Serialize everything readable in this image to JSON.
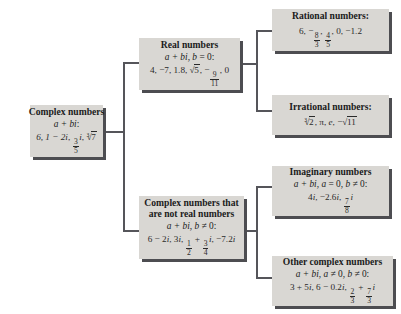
{
  "diagram": {
    "background_color": "#ffffff",
    "box_color": "#d9d7d3",
    "shadow_color": "#4d4d51",
    "line_color": "#55555a",
    "nodes": {
      "complex": {
        "title": "Complex numbers",
        "form_prefix": "a + bi",
        "form_suffix": ":",
        "examples_lead": "6, 1 − 2",
        "examples_i1": "i",
        "examples_mid": ", ",
        "frac1_num": "3",
        "frac1_den": "5",
        "examples_i2": "i",
        "examples_tail": ", ",
        "radical_index": "3",
        "radical_body": "7"
      },
      "real": {
        "title": "Real numbers",
        "form_prefix": "a + bi",
        "form_mid": ", ",
        "form_b": "b",
        "form_cond": " = 0:",
        "ex_part1": "4, −7, 1.8, ",
        "ex_sqrt": "5",
        "ex_part2": ", −",
        "frac_num": "9",
        "frac_den": "11",
        "ex_part3": ", 0"
      },
      "rational": {
        "title": "Rational numbers:",
        "ex_part1": "6, −",
        "frac1_num": "8",
        "frac1_den": "3",
        "ex_part2": ", ",
        "frac2_num": "4",
        "frac2_den": "5",
        "ex_part3": ", 0, −1.2"
      },
      "irrational": {
        "title": "Irrational numbers:",
        "radical_index": "3",
        "radical_body": "2",
        "ex_part1": ", ",
        "pi": "π",
        "ex_part2": ", ",
        "e": "e",
        "ex_part3": ", −",
        "sqrt_body": "11"
      },
      "nonreal": {
        "title_line1": "Complex numbers that",
        "title_line2": "are not real numbers",
        "form_prefix": "a + bi",
        "form_mid": ", ",
        "form_b": "b",
        "form_cond": " ≠ 0:",
        "ex_part1": "6 − 2",
        "ex_i1": "i",
        "ex_part2": ", 3",
        "ex_i2": "i",
        "ex_part3": ", ",
        "frac1_num": "1",
        "frac1_den": "2",
        "ex_plus": " + ",
        "frac2_num": "3",
        "frac2_den": "4",
        "ex_i3": "i",
        "ex_part4": ", −7.2",
        "ex_i4": "i"
      },
      "imaginary": {
        "title": "Imaginary numbers",
        "form_prefix": "a + bi",
        "form_mid1": ", ",
        "form_a": "a",
        "form_cond1": " = 0, ",
        "form_b": "b",
        "form_cond2": " ≠ 0:",
        "ex_part1": "4",
        "ex_i1": "i",
        "ex_part2": ", −2.6",
        "ex_i2": "i",
        "ex_part3": ", ",
        "frac_num": "7",
        "frac_den": "8",
        "ex_i3": "i"
      },
      "other": {
        "title": "Other complex numbers",
        "form_prefix": "a + bi",
        "form_mid1": ", ",
        "form_a": "a",
        "form_cond1": " ≠ 0, ",
        "form_b": "b",
        "form_cond2": " ≠ 0:",
        "ex_part1": "3 + 5",
        "ex_i1": "i",
        "ex_part2": ", 6 − 0.2",
        "ex_i2": "i",
        "ex_part3": ", ",
        "frac1_num": "2",
        "frac1_den": "3",
        "ex_plus": " + ",
        "frac2_num": "7",
        "frac2_den": "3",
        "ex_i3": "i"
      }
    }
  }
}
